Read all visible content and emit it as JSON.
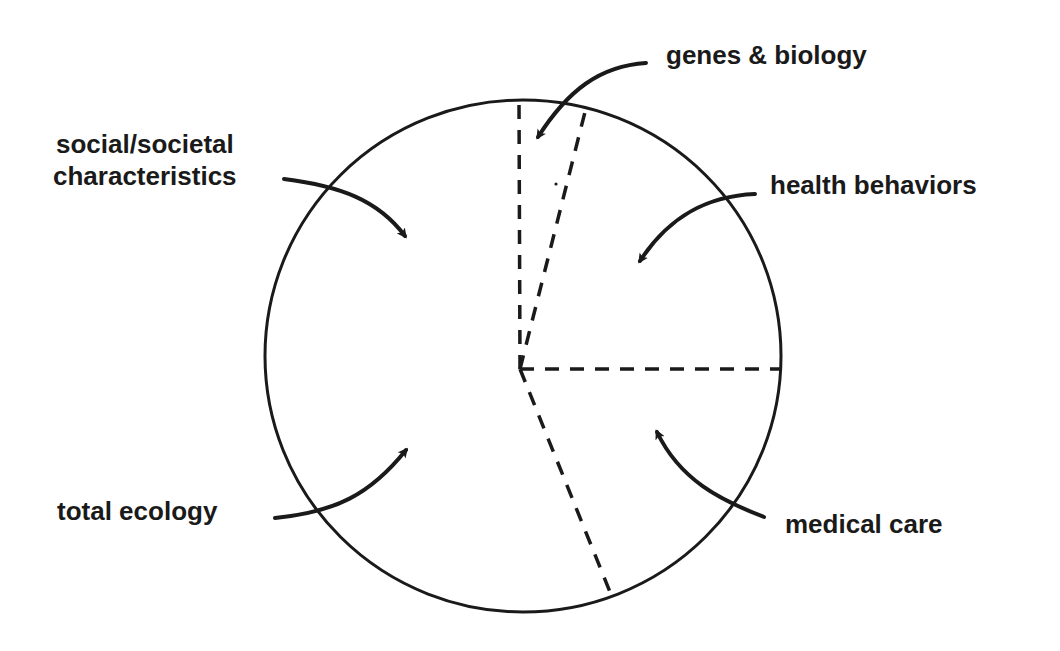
{
  "diagram": {
    "type": "pie-divided circle with labeled arrows",
    "colors": {
      "line": "#1a1a1a",
      "background": "#ffffff",
      "text": "#1a1a1a"
    },
    "segments": [
      {
        "id": "genes",
        "label": "genes & biology",
        "arrow_direction": "pointing into narrow top wedge"
      },
      {
        "id": "health",
        "label": "health behaviors",
        "arrow_direction": "pointing into upper-right wedge"
      },
      {
        "id": "medical",
        "label": "medical care",
        "arrow_direction": "pointing into lower-right wedge"
      },
      {
        "id": "ecology",
        "label": "total ecology",
        "arrow_direction": "pointing into lower-left region"
      },
      {
        "id": "social",
        "label_line1": "social/societal",
        "label_line2": "characteristics",
        "arrow_direction": "pointing into upper-left region"
      }
    ]
  },
  "labels": {
    "genes": "genes & biology",
    "social_line1": "social/societal",
    "social_line2": "characteristics",
    "health": "health behaviors",
    "ecology": "total ecology",
    "medical": "medical care"
  }
}
